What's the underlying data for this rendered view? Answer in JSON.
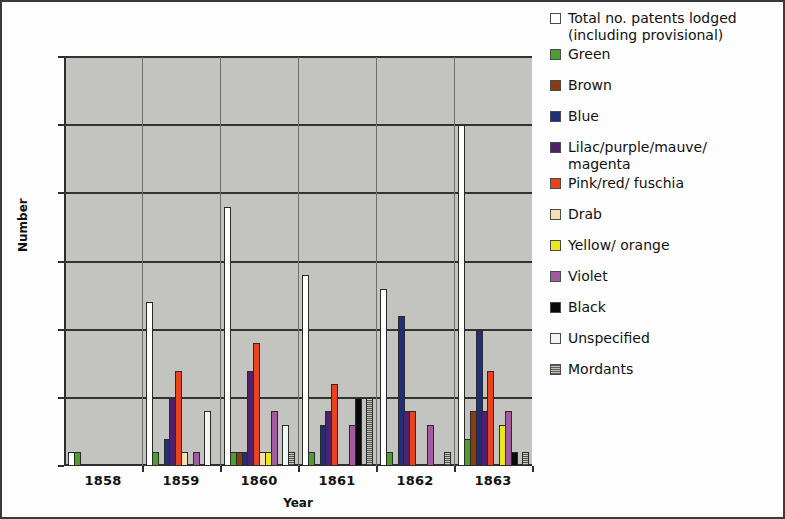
{
  "chart_data": {
    "type": "bar",
    "title": "",
    "xlabel": "Year",
    "ylabel": "Number",
    "categories": [
      "1858",
      "1859",
      "1860",
      "1861",
      "1862",
      "1863"
    ],
    "ylim": [
      0,
      30
    ],
    "yticks": [
      0,
      5,
      10,
      15,
      20,
      25,
      30
    ],
    "grid": true,
    "legend_position": "right",
    "series": [
      {
        "name": "Total no. patents lodged\n(including provisional)",
        "color": "#ffffff",
        "values": [
          1,
          12,
          19,
          14,
          13,
          25
        ]
      },
      {
        "name": "Green",
        "color": "#4f9d2b",
        "values": [
          1,
          1,
          1,
          1,
          1,
          2
        ]
      },
      {
        "name": "Brown",
        "color": "#8a3b10",
        "values": [
          0,
          0,
          1,
          0,
          0,
          4
        ]
      },
      {
        "name": "Blue",
        "color": "#1f2f7a",
        "values": [
          0,
          2,
          1,
          3,
          11,
          10
        ]
      },
      {
        "name": "Lilac/purple/mauve/\nmagenta",
        "color": "#51206a",
        "values": [
          0,
          5,
          7,
          4,
          4,
          4
        ]
      },
      {
        "name": "Pink/red/ fuschia",
        "color": "#e8431d",
        "values": [
          0,
          7,
          9,
          6,
          4,
          7
        ]
      },
      {
        "name": "Drab",
        "color": "#f5e0b0",
        "values": [
          0,
          1,
          1,
          0,
          0,
          0
        ]
      },
      {
        "name": "Yellow/ orange",
        "color": "#e8e81b",
        "values": [
          0,
          0,
          1,
          0,
          0,
          3
        ]
      },
      {
        "name": "Violet",
        "color": "#a25ba0",
        "values": [
          0,
          1,
          4,
          3,
          3,
          4
        ]
      },
      {
        "name": "Black",
        "color": "#0a0a0a",
        "values": [
          0,
          0,
          0,
          5,
          0,
          1
        ]
      },
      {
        "name": "Unspecified",
        "color": "#eef6f3",
        "values": [
          0,
          4,
          3,
          0,
          0,
          0
        ]
      },
      {
        "name": "Mordants",
        "color": "#5d6152",
        "values": [
          0,
          0,
          1,
          5,
          1,
          1
        ]
      }
    ]
  },
  "axes": {
    "ylabel": "Number",
    "xlabel": "Year",
    "ytick_labels": [
      "0",
      "5",
      "10",
      "15",
      "20",
      "25",
      "30"
    ],
    "xtick_labels": [
      "1858",
      "1859",
      "1860",
      "1861",
      "1862",
      "1863"
    ]
  },
  "legend": {
    "items": [
      {
        "label": "Total no. patents lodged\n(including provisional)",
        "swatch": "white-swatch"
      },
      {
        "label": "Green",
        "swatch": "green-swatch"
      },
      {
        "label": "Brown",
        "swatch": "brown-swatch"
      },
      {
        "label": "Blue",
        "swatch": "blue-swatch"
      },
      {
        "label": "Lilac/purple/mauve/\nmagenta",
        "swatch": "lilac-swatch"
      },
      {
        "label": "Pink/red/ fuschia",
        "swatch": "pinkred-swatch"
      },
      {
        "label": "Drab",
        "swatch": "drab-swatch"
      },
      {
        "label": "Yellow/ orange",
        "swatch": "yellow-swatch"
      },
      {
        "label": "Violet",
        "swatch": "violet-swatch"
      },
      {
        "label": "Black",
        "swatch": "black-swatch"
      },
      {
        "label": "Unspecified",
        "swatch": "unspecified-swatch"
      },
      {
        "label": "Mordants",
        "swatch": "mordants-swatch"
      }
    ]
  },
  "style": {
    "plot_background": "#c3c4bf",
    "figure_background": "#fdfdfd",
    "axis_color": "#2e2e2e",
    "grid_color": "#30332e"
  }
}
